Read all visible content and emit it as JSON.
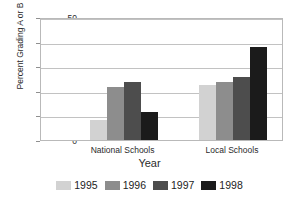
{
  "chart_data": {
    "type": "bar",
    "title": "",
    "xlabel": "Year",
    "ylabel": "Percent Grading A or B",
    "categories": [
      "National Schools",
      "Local Schools"
    ],
    "series": [
      {
        "name": "1995",
        "values": [
          8,
          22.5
        ],
        "color": "#d2d2d2"
      },
      {
        "name": "1996",
        "values": [
          21.5,
          23.5
        ],
        "color": "#8d8d8d"
      },
      {
        "name": "1997",
        "values": [
          23.5,
          25.5
        ],
        "color": "#4d4d4d"
      },
      {
        "name": "1998",
        "values": [
          11.5,
          38
        ],
        "color": "#1b1b1b"
      }
    ],
    "ylim": [
      0,
      50
    ],
    "yticks": [
      0,
      10,
      20,
      30,
      40,
      50
    ],
    "ytick_labels": [
      "0",
      "10",
      "20",
      "30",
      "40",
      "50"
    ],
    "grid": true,
    "legend_position": "bottom",
    "frame_color": "#b9b9b9",
    "gridline_color": "#c2c2c2",
    "text_color": "#2b2b2b",
    "background": "#ffffff"
  }
}
